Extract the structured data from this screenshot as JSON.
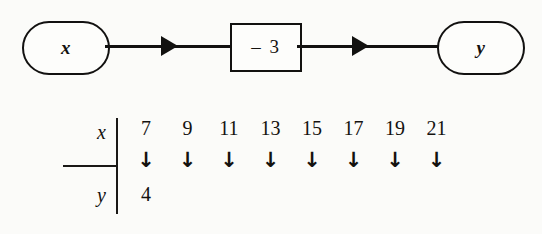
{
  "figure": {
    "type": "function-machine-diagram",
    "background_color": "#fbfbf9",
    "ink_color": "#121110"
  },
  "flow": {
    "input_node": {
      "shape": "oval",
      "label": "x"
    },
    "operation_node": {
      "shape": "rectangle",
      "label": "– 3",
      "operator": "subtract",
      "operand": 3
    },
    "output_node": {
      "shape": "oval",
      "label": "y"
    },
    "connector_1": {
      "icon": "right-arrowhead-icon"
    },
    "connector_2": {
      "icon": "right-arrowhead-icon"
    }
  },
  "table": {
    "row_labels": {
      "x": "x",
      "y": "y"
    },
    "down_arrow": "↓",
    "columns": [
      {
        "x": "7",
        "y": "4"
      },
      {
        "x": "9",
        "y": ""
      },
      {
        "x": "11",
        "y": ""
      },
      {
        "x": "13",
        "y": ""
      },
      {
        "x": "15",
        "y": ""
      },
      {
        "x": "17",
        "y": ""
      },
      {
        "x": "19",
        "y": ""
      },
      {
        "x": "21",
        "y": ""
      }
    ]
  },
  "chart_data": {
    "type": "table",
    "title": "",
    "xlabel": "x",
    "ylabel": "y",
    "categories": [
      "7",
      "9",
      "11",
      "13",
      "15",
      "17",
      "19",
      "21"
    ],
    "series": [
      {
        "name": "x",
        "values": [
          7,
          9,
          11,
          13,
          15,
          17,
          19,
          21
        ]
      },
      {
        "name": "y",
        "values": [
          4,
          null,
          null,
          null,
          null,
          null,
          null,
          null
        ]
      }
    ],
    "rule": "y = x - 3",
    "grid": false,
    "legend": "none"
  }
}
